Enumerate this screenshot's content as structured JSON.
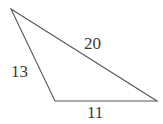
{
  "figure": {
    "name": "scalene-triangle-with-side-lengths",
    "type": "geometry-diagram",
    "background_color": "#ffffff",
    "stroke_color": "#555555",
    "text_color": "#3b3b3b",
    "stroke_width": 1.1,
    "width": 163,
    "height": 124,
    "vertices": [
      {
        "name": "top-left-apex",
        "x": 11,
        "y": 9
      },
      {
        "name": "bottom-left",
        "x": 55,
        "y": 101
      },
      {
        "name": "bottom-right",
        "x": 157,
        "y": 101
      }
    ],
    "edges": [
      {
        "name": "hypotenuse-top",
        "from": "top-left-apex",
        "to": "bottom-right",
        "label": "20"
      },
      {
        "name": "left-side",
        "from": "top-left-apex",
        "to": "bottom-left",
        "label": "13"
      },
      {
        "name": "bottom-side",
        "from": "bottom-left",
        "to": "bottom-right",
        "label": "11"
      }
    ],
    "labels": {
      "top_side": "20",
      "left_side": "13",
      "bottom_side": "11"
    }
  }
}
